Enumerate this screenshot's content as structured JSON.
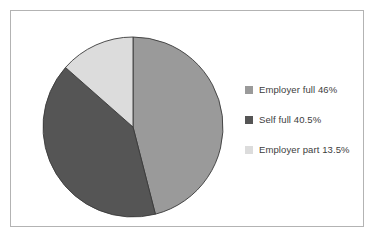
{
  "chart_data": {
    "type": "pie",
    "title": "",
    "subtitle": "",
    "xlabel": "",
    "ylabel": "",
    "grid": false,
    "legend_position": "right",
    "start_angle_deg": 0,
    "direction": "clockwise",
    "categories": [
      "Employer full",
      "Self full",
      "Employer part"
    ],
    "values": [
      46,
      40.5,
      13.5
    ],
    "value_unit": "%",
    "labels": [
      "Employer full 46%",
      "Self full 40.5%",
      "Employer part 13.5%"
    ],
    "colors": [
      "#9a9a9a",
      "#555555",
      "#dcdcdc"
    ],
    "slices": [
      {
        "name": "Employer full",
        "value": 46,
        "label": "Employer full 46%",
        "color": "#9a9a9a",
        "start_deg": 0,
        "end_deg": 165.6
      },
      {
        "name": "Self full",
        "value": 40.5,
        "label": "Self full 40.5%",
        "color": "#555555",
        "start_deg": 165.6,
        "end_deg": 311.4
      },
      {
        "name": "Employer part",
        "value": 13.5,
        "label": "Employer part 13.5%",
        "color": "#dcdcdc",
        "start_deg": 311.4,
        "end_deg": 360
      }
    ]
  },
  "legend": {
    "items": [
      {
        "label": "Employer full 46%",
        "color": "#9a9a9a",
        "swatch_name": "legend-swatch-employer-full"
      },
      {
        "label": "Self full 40.5%",
        "color": "#555555",
        "swatch_name": "legend-swatch-self-full"
      },
      {
        "label": "Employer part 13.5%",
        "color": "#dcdcdc",
        "swatch_name": "legend-swatch-employer-part"
      }
    ]
  },
  "style": {
    "background": "#ffffff",
    "frame_border": "#b3b3b3",
    "slice_outline": "#3a3a3a",
    "legend_text": "#3d3d3d"
  }
}
